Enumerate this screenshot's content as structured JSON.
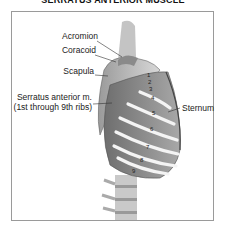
{
  "title": "SERRATUS ANTERIOR MUSCLE",
  "labels": {
    "acromion": "Acromion",
    "coracoid": "Coracoid",
    "scapula": "Scapula",
    "serratus_line1": "Serratus anterior m.",
    "serratus_line2": "(1st through 9th ribs)",
    "sternum": "Sternum"
  },
  "rib_numbers": [
    "1",
    "2",
    "3",
    "4",
    "5",
    "6",
    "7",
    "8",
    "9"
  ]
}
